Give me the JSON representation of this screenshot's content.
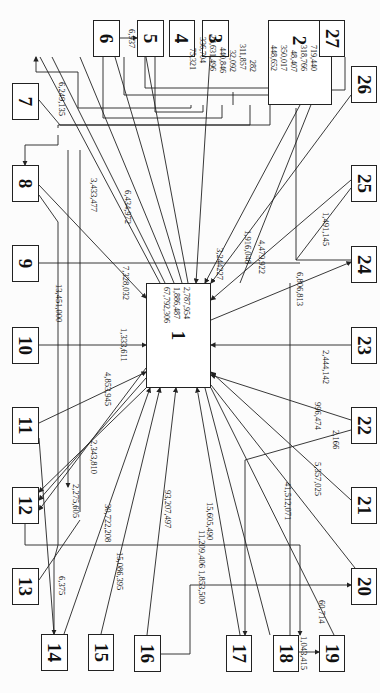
{
  "diagram": {
    "nodes": [
      {
        "id": "1",
        "x": 146,
        "y": 283,
        "w": 65,
        "h": 105
      },
      {
        "id": "2",
        "x": 268,
        "y": 20,
        "w": 64,
        "h": 85
      },
      {
        "id": "3",
        "x": 202,
        "y": 20,
        "w": 27,
        "h": 37
      },
      {
        "id": "4",
        "x": 169,
        "y": 20,
        "w": 26,
        "h": 37
      },
      {
        "id": "5",
        "x": 137,
        "y": 20,
        "w": 27,
        "h": 37
      },
      {
        "id": "6",
        "x": 93,
        "y": 20,
        "w": 27,
        "h": 37
      },
      {
        "id": "7",
        "x": 12,
        "y": 83,
        "w": 27,
        "h": 37
      },
      {
        "id": "8",
        "x": 12,
        "y": 165,
        "w": 27,
        "h": 37
      },
      {
        "id": "9",
        "x": 12,
        "y": 245,
        "w": 27,
        "h": 37
      },
      {
        "id": "10",
        "x": 12,
        "y": 327,
        "w": 27,
        "h": 37
      },
      {
        "id": "11",
        "x": 12,
        "y": 407,
        "w": 27,
        "h": 37
      },
      {
        "id": "12",
        "x": 12,
        "y": 487,
        "w": 27,
        "h": 37
      },
      {
        "id": "13",
        "x": 12,
        "y": 568,
        "w": 27,
        "h": 37
      },
      {
        "id": "14",
        "x": 41,
        "y": 634,
        "w": 27,
        "h": 37
      },
      {
        "id": "15",
        "x": 88,
        "y": 634,
        "w": 26,
        "h": 37
      },
      {
        "id": "16",
        "x": 134,
        "y": 635,
        "w": 27,
        "h": 37
      },
      {
        "id": "17",
        "x": 226,
        "y": 635,
        "w": 26,
        "h": 37
      },
      {
        "id": "18",
        "x": 273,
        "y": 635,
        "w": 26,
        "h": 37
      },
      {
        "id": "19",
        "x": 319,
        "y": 635,
        "w": 26,
        "h": 37
      },
      {
        "id": "20",
        "x": 351,
        "y": 568,
        "w": 26,
        "h": 37
      },
      {
        "id": "21",
        "x": 351,
        "y": 487,
        "w": 26,
        "h": 37
      },
      {
        "id": "22",
        "x": 351,
        "y": 407,
        "w": 26,
        "h": 37
      },
      {
        "id": "23",
        "x": 351,
        "y": 327,
        "w": 26,
        "h": 37
      },
      {
        "id": "24",
        "x": 351,
        "y": 246,
        "w": 26,
        "h": 37
      },
      {
        "id": "25",
        "x": 351,
        "y": 165,
        "w": 26,
        "h": 37
      },
      {
        "id": "26",
        "x": 351,
        "y": 66,
        "w": 26,
        "h": 37
      },
      {
        "id": "27",
        "x": 319,
        "y": 20,
        "w": 26,
        "h": 37
      }
    ],
    "node2_values": [
      "75,321",
      "336,704",
      "24,631,496",
      "440,846",
      "32,092",
      "311,857",
      "282",
      "448,652",
      "350,017",
      "48,407",
      "318,766",
      "719,440"
    ],
    "node1_values": [
      "67,792,306",
      "1,886,487",
      "2,787,954"
    ],
    "flow_labels": [
      {
        "text": "6,937",
        "x": 68,
        "y": 29
      },
      {
        "text": "6,249,135",
        "x": 64,
        "y": 82
      },
      {
        "text": "3,433,477",
        "x": 98,
        "y": 180
      },
      {
        "text": "6,434,972",
        "x": 131,
        "y": 192
      },
      {
        "text": "7,328,032",
        "x": 128,
        "y": 268
      },
      {
        "text": "13,451,000",
        "x": 63,
        "y": 287
      },
      {
        "text": "1,333,611",
        "x": 128,
        "y": 330
      },
      {
        "text": "4,853,945",
        "x": 112,
        "y": 372
      },
      {
        "text": "2,343,810",
        "x": 100,
        "y": 440
      },
      {
        "text": "2,275,605",
        "x": 82,
        "y": 485
      },
      {
        "text": "30,722,208",
        "x": 106,
        "y": 505
      },
      {
        "text": "15,086,395",
        "x": 118,
        "y": 560
      },
      {
        "text": "93,207,497",
        "x": 174,
        "y": 490
      },
      {
        "text": "6,375",
        "x": 66,
        "y": 577
      },
      {
        "text": "11,209,406",
        "x": 206,
        "y": 534
      },
      {
        "text": "15,605,490",
        "x": 216,
        "y": 513
      },
      {
        "text": "1,853,500",
        "x": 206,
        "y": 574
      },
      {
        "text": "41,512,071",
        "x": 292,
        "y": 487
      },
      {
        "text": "60,714",
        "x": 326,
        "y": 607
      },
      {
        "text": "1,043,415",
        "x": 307,
        "y": 637
      },
      {
        "text": "5,357,025",
        "x": 325,
        "y": 466
      },
      {
        "text": "2,166",
        "x": 340,
        "y": 432
      },
      {
        "text": "996,474",
        "x": 325,
        "y": 405
      },
      {
        "text": "2,444,142",
        "x": 330,
        "y": 354
      },
      {
        "text": "6,806,813",
        "x": 305,
        "y": 276
      },
      {
        "text": "4,479,922",
        "x": 266,
        "y": 244
      },
      {
        "text": "1,916,048",
        "x": 252,
        "y": 232
      },
      {
        "text": "3,244227",
        "x": 224,
        "y": 250
      },
      {
        "text": "1,491,145",
        "x": 330,
        "y": 215
      }
    ]
  }
}
